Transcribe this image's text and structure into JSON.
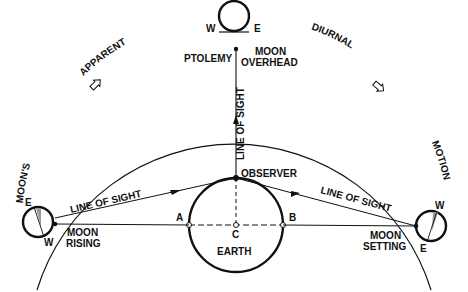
{
  "arc_labels": {
    "moons": "MOON'S",
    "apparent": "APPARENT",
    "diurnal": "DIURNAL",
    "motion": "MOTION"
  },
  "moon_overhead": {
    "west": "W",
    "east": "E",
    "label_line1": "MOON",
    "label_line2": "OVERHEAD",
    "ptolemy": "PTOLEMY"
  },
  "moon_rising": {
    "east": "E",
    "west": "W",
    "label_line1": "MOON",
    "label_line2": "RISING"
  },
  "moon_setting": {
    "west": "W",
    "east": "E",
    "label_line1": "MOON",
    "label_line2": "SETTING"
  },
  "lines_of_sight": {
    "vertical": "LINE OF SIGHT",
    "left": "LINE OF SIGHT",
    "right": "LINE OF SIGHT"
  },
  "earth": {
    "label": "EARTH",
    "observer": "OBSERVER",
    "point_a": "A",
    "point_b": "B",
    "point_c": "C"
  },
  "colors": {
    "ink": "#111111",
    "background": "#ffffff",
    "shade": "#888888"
  }
}
